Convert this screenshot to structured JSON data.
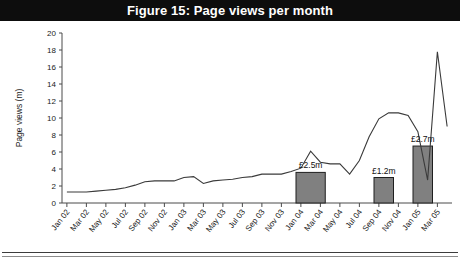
{
  "figure": {
    "title": "Figure 15: Page views per month",
    "title_bar_color": "#0d0d0d",
    "title_text_color": "#ffffff"
  },
  "chart_data": {
    "type": "line",
    "title": "Figure 15: Page views per month",
    "xlabel": "",
    "ylabel": "Page views (m)",
    "ylim": [
      0,
      20
    ],
    "ytick_step": 2,
    "yticks": [
      0,
      2,
      4,
      6,
      8,
      10,
      12,
      14,
      16,
      18,
      20
    ],
    "ytick_labels": [
      "0",
      "2",
      "4",
      "6",
      "8",
      "10",
      "12",
      "14",
      "16",
      "18",
      "20"
    ],
    "grid": false,
    "legend": "none",
    "xtick_labels": [
      "Jan 02",
      "Mar 02",
      "May 02",
      "Jul 02",
      "Sep 02",
      "Nov 02",
      "Jan 03",
      "Mar 03",
      "May 03",
      "Jul 03",
      "Sep 03",
      "Nov 03",
      "Jan 04",
      "Mar 04",
      "May 04",
      "Jul 04",
      "Sep 04",
      "Nov 04",
      "Jan 05",
      "Mar 05"
    ],
    "x": [
      "Jan 02",
      "Feb 02",
      "Mar 02",
      "Apr 02",
      "May 02",
      "Jun 02",
      "Jul 02",
      "Aug 02",
      "Sep 02",
      "Oct 02",
      "Nov 02",
      "Dec 02",
      "Jan 03",
      "Feb 03",
      "Mar 03",
      "Apr 03",
      "May 03",
      "Jun 03",
      "Jul 03",
      "Aug 03",
      "Sep 03",
      "Oct 03",
      "Nov 03",
      "Dec 03",
      "Jan 04",
      "Feb 04",
      "Mar 04",
      "Apr 04",
      "May 04",
      "Jun 04",
      "Jul 04",
      "Aug 04",
      "Sep 04",
      "Oct 04",
      "Nov 04",
      "Dec 04",
      "Jan 05",
      "Feb 05",
      "Mar 05",
      "Apr 05"
    ],
    "series": [
      {
        "name": "Page views (m)",
        "color": "#3a3a3a",
        "values": [
          1.3,
          1.3,
          1.3,
          1.4,
          1.5,
          1.6,
          1.8,
          2.1,
          2.5,
          2.6,
          2.6,
          2.6,
          3.0,
          3.1,
          2.3,
          2.6,
          2.7,
          2.8,
          3.0,
          3.1,
          3.4,
          3.4,
          3.4,
          3.7,
          4.1,
          6.1,
          4.8,
          4.6,
          4.6,
          3.4,
          5.0,
          7.8,
          9.9,
          10.6,
          10.6,
          10.3,
          8.4,
          2.7,
          17.8,
          9.0
        ]
      }
    ],
    "bars": [
      {
        "label": "£2.5m",
        "start": "Jan 04",
        "end": "Apr 04",
        "value": 3.6,
        "color": "#808080"
      },
      {
        "label": "£1.2m",
        "start": "Sep 04",
        "end": "Nov 04",
        "value": 3.0,
        "color": "#808080"
      },
      {
        "label": "£2.7m",
        "start": "Jan 05",
        "end": "Mar 05",
        "value": 6.7,
        "color": "#808080"
      }
    ]
  }
}
